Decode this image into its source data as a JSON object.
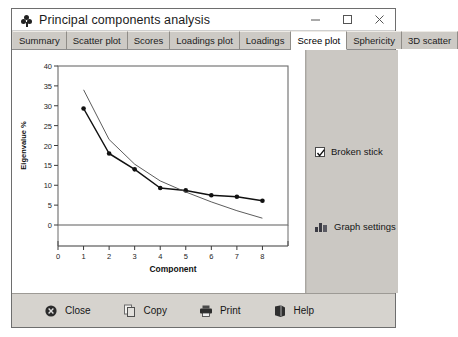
{
  "window": {
    "title": "Principal components analysis",
    "icon": "clover-icon",
    "controls": [
      {
        "name": "minimize",
        "glyph": "minimize-icon"
      },
      {
        "name": "maximize",
        "glyph": "maximize-icon"
      },
      {
        "name": "close",
        "glyph": "close-icon"
      }
    ]
  },
  "tabs": [
    {
      "label": "Summary",
      "active": false
    },
    {
      "label": "Scatter plot",
      "active": false
    },
    {
      "label": "Scores",
      "active": false
    },
    {
      "label": "Loadings plot",
      "active": false
    },
    {
      "label": "Loadings",
      "active": false
    },
    {
      "label": "Scree plot",
      "active": true
    },
    {
      "label": "Sphericity",
      "active": false
    },
    {
      "label": "3D scatter",
      "active": false
    }
  ],
  "side_panel": {
    "broken_stick": {
      "label": "Broken stick",
      "checked": true
    },
    "graph_settings": {
      "label": "Graph settings",
      "icon": "bar-chart-icon"
    }
  },
  "bottom_bar": {
    "buttons": [
      {
        "label": "Close",
        "icon": "close-circle-icon"
      },
      {
        "label": "Copy",
        "icon": "copy-icon"
      },
      {
        "label": "Print",
        "icon": "printer-icon"
      },
      {
        "label": "Help",
        "icon": "help-book-icon"
      }
    ]
  },
  "colors": {
    "window_bg": "#d6d3ce",
    "panel_bg": "#cbc8c3",
    "plot_bg": "#ffffff",
    "axis": "#555555",
    "series_main": "#1a1a1a",
    "series_broken": "#444444"
  },
  "chart_data": {
    "type": "line",
    "title": "",
    "xlabel": "Component",
    "ylabel": "Eigenvalue %",
    "xlim": [
      0,
      9
    ],
    "ylim": [
      0,
      40
    ],
    "xticks": [
      0,
      1,
      2,
      3,
      4,
      5,
      6,
      7,
      8
    ],
    "yticks": [
      0,
      5,
      10,
      15,
      20,
      25,
      30,
      35,
      40
    ],
    "grid": false,
    "legend": "none",
    "x": [
      1,
      2,
      3,
      4,
      5,
      6,
      7,
      8
    ],
    "series": [
      {
        "name": "Eigenvalue %",
        "markers": true,
        "values": [
          29.3,
          18.0,
          14.0,
          9.3,
          8.7,
          7.5,
          7.1,
          6.1
        ]
      },
      {
        "name": "Broken stick",
        "markers": false,
        "values": [
          34.0,
          21.5,
          15.3,
          11.1,
          8.3,
          5.8,
          3.6,
          1.7
        ]
      }
    ]
  }
}
